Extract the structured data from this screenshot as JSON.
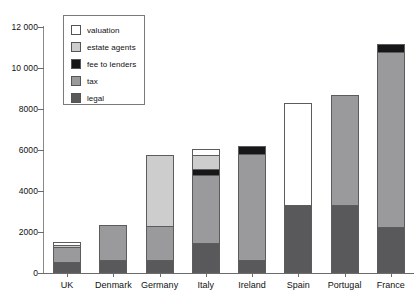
{
  "chart_data": {
    "type": "bar",
    "stacked": true,
    "title": "",
    "subtitle": "",
    "xlabel": "",
    "ylabel": "",
    "ylim": [
      0,
      12000
    ],
    "ytick_step": 2000,
    "ytick_labels": [
      "0",
      "2000",
      "4000",
      "6000",
      "8000",
      "10 000",
      "12 000"
    ],
    "ytick_values": [
      0,
      2000,
      4000,
      6000,
      8000,
      10000,
      12000
    ],
    "grid": false,
    "legend_position": "top-left-inside",
    "categories": [
      "UK",
      "Denmark",
      "Germany",
      "Italy",
      "Ireland",
      "Spain",
      "Portugal",
      "France"
    ],
    "series": [
      {
        "name": "legal",
        "color": "#59595b",
        "values": [
          540,
          590,
          540,
          1460,
          540,
          3270,
          3270,
          2200
        ]
      },
      {
        "name": "tax",
        "color": "#9a9a9c",
        "values": [
          780,
          1730,
          1660,
          3390,
          5300,
          0,
          5390,
          8630
        ]
      },
      {
        "name": "fee to lenders",
        "color": "#17171a",
        "values": [
          0,
          0,
          0,
          290,
          340,
          0,
          0,
          340
        ]
      },
      {
        "name": "estate agents",
        "color": "#cdcdcd",
        "values": [
          100,
          0,
          3560,
          630,
          0,
          0,
          0,
          0
        ]
      },
      {
        "name": "valuation",
        "color": "#ffffff",
        "values": [
          100,
          0,
          0,
          290,
          0,
          5000,
          0,
          0
        ]
      }
    ],
    "totals": [
      1520,
      2320,
      5760,
      6060,
      6180,
      8270,
      8660,
      11170
    ],
    "legend_entries": [
      {
        "label": "valuation",
        "color": "#ffffff"
      },
      {
        "label": "estate agents",
        "color": "#cdcdcd"
      },
      {
        "label": "fee to lenders",
        "color": "#17171a"
      },
      {
        "label": "tax",
        "color": "#9a9a9c"
      },
      {
        "label": "legal",
        "color": "#59595b"
      }
    ]
  }
}
